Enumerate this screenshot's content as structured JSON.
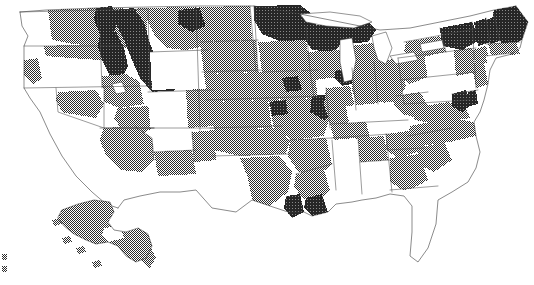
{
  "figure": {
    "kind": "choropleth-map",
    "title": "",
    "subtitle": "",
    "has_legend": false,
    "has_axis": false,
    "has_labels": false,
    "background_color": "#ffffff",
    "width_px": 534,
    "height_px": 285,
    "projection": "albers-usa",
    "geography_level": "county",
    "border_color": "#4a4a4a",
    "insets": [
      "alaska",
      "hawaii"
    ]
  },
  "chart_data": {
    "type": "heatmap",
    "title": "",
    "xlabel": "",
    "ylabel": "",
    "legend_position": "none",
    "grid": false,
    "classes": [
      {
        "id": "low",
        "label": "",
        "color": "#ffffff",
        "tone": "white",
        "rank": 0
      },
      {
        "id": "mid",
        "label": "",
        "color": "#808080",
        "tone": "medium-gray",
        "rank": 1
      },
      {
        "id": "high",
        "label": "",
        "color": "#353535",
        "tone": "dark-gray",
        "rank": 2
      }
    ],
    "regions": [
      {
        "name": "washington-coast",
        "class": "low"
      },
      {
        "name": "washington-east",
        "class": "mid"
      },
      {
        "name": "oregon-north",
        "class": "mid"
      },
      {
        "name": "oregon-central",
        "class": "low"
      },
      {
        "name": "oregon-southwest",
        "class": "mid"
      },
      {
        "name": "idaho-panhandle",
        "class": "high"
      },
      {
        "name": "idaho-central",
        "class": "high"
      },
      {
        "name": "idaho-south",
        "class": "mid"
      },
      {
        "name": "montana-west",
        "class": "high"
      },
      {
        "name": "montana-east",
        "class": "mid"
      },
      {
        "name": "wyoming",
        "class": "low"
      },
      {
        "name": "north-dakota-northeast",
        "class": "high"
      },
      {
        "name": "north-dakota-west",
        "class": "mid"
      },
      {
        "name": "south-dakota",
        "class": "mid"
      },
      {
        "name": "nebraska",
        "class": "mid"
      },
      {
        "name": "nevada",
        "class": "low"
      },
      {
        "name": "nevada-north",
        "class": "mid"
      },
      {
        "name": "utah-north",
        "class": "mid"
      },
      {
        "name": "utah-south",
        "class": "mid"
      },
      {
        "name": "california",
        "class": "low"
      },
      {
        "name": "arizona",
        "class": "mid"
      },
      {
        "name": "new-mexico-north",
        "class": "low"
      },
      {
        "name": "new-mexico-south",
        "class": "mid"
      },
      {
        "name": "colorado-west",
        "class": "low"
      },
      {
        "name": "colorado-front-range",
        "class": "mid"
      },
      {
        "name": "kansas",
        "class": "mid"
      },
      {
        "name": "oklahoma",
        "class": "mid"
      },
      {
        "name": "texas-panhandle",
        "class": "mid"
      },
      {
        "name": "texas-central",
        "class": "low"
      },
      {
        "name": "texas-east",
        "class": "mid"
      },
      {
        "name": "texas-gulf",
        "class": "high"
      },
      {
        "name": "minnesota-north",
        "class": "high"
      },
      {
        "name": "minnesota-south",
        "class": "mid"
      },
      {
        "name": "wisconsin-north",
        "class": "high"
      },
      {
        "name": "wisconsin-south",
        "class": "mid"
      },
      {
        "name": "michigan-upper",
        "class": "high"
      },
      {
        "name": "michigan-lower",
        "class": "mid"
      },
      {
        "name": "iowa",
        "class": "mid"
      },
      {
        "name": "iowa-desmoines",
        "class": "high"
      },
      {
        "name": "missouri",
        "class": "mid"
      },
      {
        "name": "missouri-kansas-city",
        "class": "high"
      },
      {
        "name": "missouri-stlouis",
        "class": "high"
      },
      {
        "name": "illinois-chicago",
        "class": "high"
      },
      {
        "name": "illinois-south",
        "class": "mid"
      },
      {
        "name": "indiana",
        "class": "mid"
      },
      {
        "name": "ohio",
        "class": "mid"
      },
      {
        "name": "kentucky",
        "class": "low"
      },
      {
        "name": "tennessee-west",
        "class": "mid"
      },
      {
        "name": "tennessee-east",
        "class": "low"
      },
      {
        "name": "arkansas",
        "class": "mid"
      },
      {
        "name": "louisiana-north",
        "class": "mid"
      },
      {
        "name": "louisiana-neworleans",
        "class": "high"
      },
      {
        "name": "mississippi",
        "class": "low"
      },
      {
        "name": "alabama-north",
        "class": "mid"
      },
      {
        "name": "alabama-south",
        "class": "low"
      },
      {
        "name": "georgia-north",
        "class": "mid"
      },
      {
        "name": "georgia-south",
        "class": "mid"
      },
      {
        "name": "florida",
        "class": "low"
      },
      {
        "name": "south-carolina",
        "class": "mid"
      },
      {
        "name": "north-carolina",
        "class": "mid"
      },
      {
        "name": "virginia",
        "class": "mid"
      },
      {
        "name": "west-virginia",
        "class": "mid"
      },
      {
        "name": "maryland-baltimore",
        "class": "high"
      },
      {
        "name": "delaware",
        "class": "high"
      },
      {
        "name": "pennsylvania-west",
        "class": "mid"
      },
      {
        "name": "pennsylvania-central",
        "class": "low"
      },
      {
        "name": "pennsylvania-east",
        "class": "mid"
      },
      {
        "name": "new-york-west",
        "class": "mid"
      },
      {
        "name": "new-york-north",
        "class": "high"
      },
      {
        "name": "new-york-city",
        "class": "mid"
      },
      {
        "name": "vermont",
        "class": "high"
      },
      {
        "name": "new-hampshire",
        "class": "high"
      },
      {
        "name": "maine",
        "class": "high"
      },
      {
        "name": "massachusetts",
        "class": "mid"
      },
      {
        "name": "connecticut",
        "class": "low"
      },
      {
        "name": "rhode-island",
        "class": "low"
      },
      {
        "name": "new-jersey",
        "class": "mid"
      },
      {
        "name": "alaska",
        "class": "mid"
      },
      {
        "name": "hawaii",
        "class": "low"
      }
    ],
    "class_counts": {
      "low": 23,
      "mid": 40,
      "high": 16
    }
  },
  "water_bodies": [
    {
      "name": "lake-superior"
    },
    {
      "name": "lake-michigan"
    },
    {
      "name": "lake-huron"
    },
    {
      "name": "lake-erie"
    },
    {
      "name": "lake-ontario"
    },
    {
      "name": "great-salt-lake"
    }
  ],
  "inset_labels": {
    "alaska": "",
    "hawaii": ""
  }
}
